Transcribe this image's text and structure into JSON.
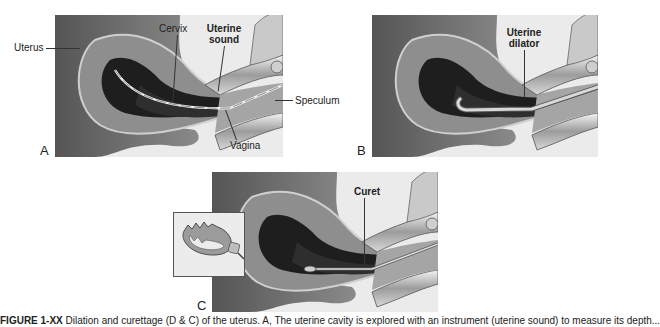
{
  "figure": {
    "panels": [
      {
        "id": "A",
        "letter": "A",
        "instrument": "uterine sound",
        "labels": {
          "uterus": "Uterus",
          "cervix": "Cervix",
          "instrument_line1": "Uterine",
          "instrument_line2": "sound",
          "speculum": "Speculum",
          "vagina": "Vagina"
        }
      },
      {
        "id": "B",
        "letter": "B",
        "instrument": "uterine dilator",
        "labels": {
          "instrument_line1": "Uterine",
          "instrument_line2": "dilator"
        }
      },
      {
        "id": "C",
        "letter": "C",
        "instrument": "curet",
        "labels": {
          "instrument": "Curet"
        },
        "inset": "curet-tip-closeup"
      }
    ],
    "caption": {
      "prefix": "FIGURE 1-XX",
      "text": "Dilation and curettage (D & C) of the uterus. A, The uterine cavity is explored with an instrument (uterine sound) to measure its depth..."
    },
    "colors": {
      "background": "#ffffff",
      "panel_bg": "#e9e9e9",
      "tissue_dark": "#5e5e5e",
      "tissue_mid": "#9a9a9a",
      "cavity": "#1c1c1c",
      "speculum_metal": "#b5b5b5"
    }
  }
}
